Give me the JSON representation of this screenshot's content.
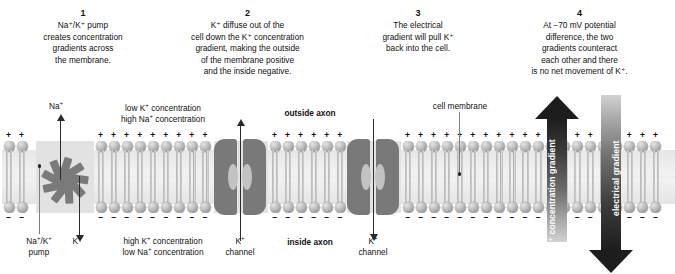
{
  "figure": {
    "title_absent": true,
    "background_color": "#ffffff",
    "membrane_color": "#9e9e9e",
    "protein_color": "#797979",
    "arrow_color": "#2b2b2b"
  },
  "steps": [
    {
      "number": "1",
      "text": "Na⁺/K⁺ pump creates concentration gradients across the membrane.",
      "lines": [
        "Na⁺/K⁺ pump",
        "creates concentration",
        "gradients across",
        "the membrane."
      ]
    },
    {
      "number": "2",
      "text": "K⁺ diffuse out of the cell down the K⁺ concentration gradient, making the outside of the membrane positive and the inside negative.",
      "lines": [
        "K⁺ diffuse out of the",
        "cell down the K⁺ concentration",
        "gradient, making the outside",
        "of the membrane positive",
        "and the inside negative."
      ]
    },
    {
      "number": "3",
      "text": "The electrical gradient will pull K⁺ back into the cell.",
      "lines": [
        "The electrical",
        "gradient will pull K⁺",
        "back into the cell."
      ]
    },
    {
      "number": "4",
      "text": "At −70 mV potential difference, the two gradients counteract each other and there is no net movement of K⁺.",
      "lines": [
        "At −70 mV potential",
        "difference, the two",
        "gradients counteract",
        "each other and there",
        "is no net movement of K⁺."
      ]
    }
  ],
  "diagram_labels": {
    "na_efflux": "Na⁺",
    "k_influx": "K⁺",
    "pump_line1": "Na⁺/K⁺",
    "pump_line2": "pump",
    "outside_conc_line1": "low K⁺ concentration",
    "outside_conc_line2": "high Na⁺ concentration",
    "inside_conc_line1": "high K⁺ concentration",
    "inside_conc_line2": "low Na⁺ concentration",
    "outside_axon": "outside axon",
    "inside_axon": "inside axon",
    "cell_membrane": "cell membrane",
    "channel_1_line1": "K⁺",
    "channel_1_line2": "channel",
    "channel_2_line1": "K⁺",
    "channel_2_line2": "channel",
    "k_concentration_gradient": "K⁺ concentration gradient",
    "electrical_gradient": "electrical gradient",
    "outer_charge_symbol": "+",
    "inner_charge_symbol": "–"
  },
  "chart_data": {
    "type": "diagram",
    "membrane": {
      "structure": "phospholipid bilayer",
      "outer_leaflet_charge": "positive (+)",
      "inner_leaflet_charge": "negative (–)"
    },
    "proteins": [
      {
        "name": "Na⁺/K⁺ pump",
        "x_px": 65,
        "transports": [
          "Na⁺ out",
          "K⁺ in"
        ]
      },
      {
        "name": "K⁺ channel",
        "x_px": 240,
        "flow": "K⁺ out of cell"
      },
      {
        "name": "K⁺ channel",
        "x_px": 373,
        "flow": "K⁺ into cell"
      }
    ],
    "gradients": [
      {
        "name": "K⁺ concentration gradient",
        "direction": "outward (up)",
        "x_px": 557
      },
      {
        "name": "electrical gradient",
        "direction": "inward (down)",
        "x_px": 611
      }
    ],
    "resting_potential_mV": -70
  }
}
